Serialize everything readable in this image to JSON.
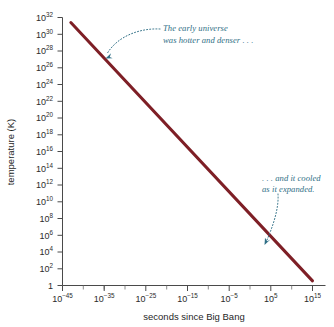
{
  "figure": {
    "background_color": "#ffffff",
    "axis_color": "#4a4a4a",
    "line_color": "#7e1f26",
    "annotation_color": "#2f6f86"
  },
  "chart_data": {
    "type": "line",
    "title": "",
    "subtitle": "",
    "xlabel": "seconds since Big Bang",
    "ylabel": "temperature (K)",
    "xscale": "log",
    "yscale": "log",
    "xlim": [
      1e-47,
      3.2e+16
    ],
    "ylim": [
      1,
      1e+32
    ],
    "grid": false,
    "legend": null,
    "xtick_labels": [
      "10−45",
      "10−35",
      "10−25",
      "10−15",
      "10−5",
      "105",
      "1015"
    ],
    "xtick_bases": [
      "10",
      "10",
      "10",
      "10",
      "10",
      "10",
      "10"
    ],
    "xtick_exponents": [
      "−45",
      "−35",
      "−25",
      "−15",
      "−5",
      "5",
      "15"
    ],
    "xtick_exponent_values": [
      -45,
      -35,
      -25,
      -15,
      -5,
      5,
      15
    ],
    "ytick_bases": [
      "1",
      "10",
      "10",
      "10",
      "10",
      "10",
      "10",
      "10",
      "10",
      "10",
      "10",
      "10",
      "10",
      "10",
      "10",
      "10",
      "10"
    ],
    "ytick_exponents": [
      "",
      "2",
      "4",
      "6",
      "8",
      "10",
      "12",
      "14",
      "16",
      "18",
      "20",
      "22",
      "24",
      "26",
      "28",
      "30",
      "32"
    ],
    "ytick_exponent_values": [
      0,
      2,
      4,
      6,
      8,
      10,
      12,
      14,
      16,
      18,
      20,
      22,
      24,
      26,
      28,
      30,
      32
    ],
    "series": [
      {
        "name": "temperature of the universe",
        "color": "#7e1f26",
        "x_log10": [
          -43,
          15
        ],
        "y_log10": [
          31.4,
          0.55
        ],
        "points": [
          {
            "x": "1e-43",
            "y": "2.5e31"
          },
          {
            "x": "1e15",
            "y": "3.5"
          }
        ]
      }
    ],
    "annotations": [
      {
        "id": "early-universe",
        "text_line1": "The early universe",
        "text_line2": "was hotter and denser . . .",
        "color": "#2f6f86",
        "points_to": {
          "x": "1e-35",
          "y": "1e26"
        }
      },
      {
        "id": "cooled-expanded",
        "text_line1": ". . . and it cooled",
        "text_line2": "as it expanded.",
        "color": "#2f6f86",
        "points_to": {
          "x": "1e11",
          "y": "1e6"
        }
      }
    ]
  }
}
